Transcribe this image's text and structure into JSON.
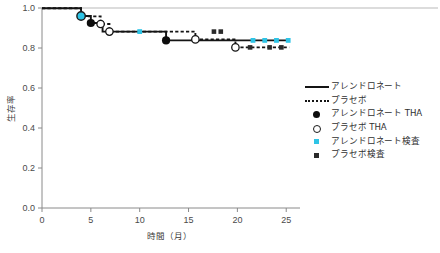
{
  "chart_data": {
    "type": "line",
    "title": "",
    "xlabel": "時間（月）",
    "ylabel": "生存率",
    "xlim": [
      0,
      26
    ],
    "ylim": [
      0.0,
      1.0
    ],
    "xticks": [
      0,
      5,
      10,
      15,
      20,
      25
    ],
    "xticklabels": [
      "0",
      "5",
      "10",
      "15",
      "20",
      "25"
    ],
    "yticks": [
      0.0,
      0.2,
      0.4,
      0.6,
      0.8,
      1.0
    ],
    "yticklabels": [
      "0.0",
      "0.2",
      "0.4",
      "0.6",
      "0.8",
      "1.0"
    ],
    "grid": false,
    "legend_position": "right",
    "series": [
      {
        "name": "アレンドロネート",
        "style": "solid",
        "color": "#141414",
        "steps": [
          {
            "x": 0.0,
            "y": 0.999
          },
          {
            "x": 4.0,
            "y": 0.999
          },
          {
            "x": 4.0,
            "y": 0.96
          },
          {
            "x": 5.0,
            "y": 0.96
          },
          {
            "x": 5.0,
            "y": 0.925
          },
          {
            "x": 6.2,
            "y": 0.925
          },
          {
            "x": 6.2,
            "y": 0.882
          },
          {
            "x": 12.7,
            "y": 0.882
          },
          {
            "x": 12.7,
            "y": 0.838
          },
          {
            "x": 25.3,
            "y": 0.838
          }
        ]
      },
      {
        "name": "プラセボ",
        "style": "dotted",
        "color": "#141414",
        "steps": [
          {
            "x": 0.0,
            "y": 0.999
          },
          {
            "x": 4.0,
            "y": 0.999
          },
          {
            "x": 4.0,
            "y": 0.958
          },
          {
            "x": 6.0,
            "y": 0.958
          },
          {
            "x": 6.0,
            "y": 0.92
          },
          {
            "x": 6.9,
            "y": 0.92
          },
          {
            "x": 6.9,
            "y": 0.882
          },
          {
            "x": 15.7,
            "y": 0.882
          },
          {
            "x": 15.7,
            "y": 0.843
          },
          {
            "x": 19.8,
            "y": 0.843
          },
          {
            "x": 19.8,
            "y": 0.803
          },
          {
            "x": 25.3,
            "y": 0.803
          }
        ]
      }
    ],
    "markers": [
      {
        "series": "アレンドロネート THA",
        "type": "filled-circle",
        "points": [
          {
            "x": 5.0,
            "y": 0.925
          },
          {
            "x": 12.7,
            "y": 0.838
          }
        ]
      },
      {
        "series": "プラセボ THA",
        "type": "open-circle",
        "points": [
          {
            "x": 6.0,
            "y": 0.92
          },
          {
            "x": 6.9,
            "y": 0.882
          },
          {
            "x": 15.7,
            "y": 0.843
          },
          {
            "x": 19.8,
            "y": 0.803
          }
        ]
      },
      {
        "series": "アレンドロネート検査",
        "type": "cyan-square",
        "points": [
          {
            "x": 4.0,
            "y": 0.96
          },
          {
            "x": 10.0,
            "y": 0.882
          },
          {
            "x": 21.6,
            "y": 0.838
          },
          {
            "x": 22.8,
            "y": 0.838
          },
          {
            "x": 24.0,
            "y": 0.838
          },
          {
            "x": 25.2,
            "y": 0.838
          }
        ]
      },
      {
        "series": "プラセボ検査",
        "type": "dark-square",
        "points": [
          {
            "x": 17.6,
            "y": 0.882
          },
          {
            "x": 18.3,
            "y": 0.882
          },
          {
            "x": 21.3,
            "y": 0.803
          },
          {
            "x": 23.3,
            "y": 0.803
          },
          {
            "x": 24.5,
            "y": 0.803
          }
        ]
      }
    ]
  },
  "legend": {
    "items": [
      {
        "label": "アレンドロネート",
        "key": "solid-line"
      },
      {
        "label": "プラセボ",
        "key": "dotted-line"
      },
      {
        "label": "アレンドロネート THA",
        "key": "filled-circle"
      },
      {
        "label": "プラセボ THA",
        "key": "open-circle"
      },
      {
        "label": "アレンドロネート検査",
        "key": "cyan-square"
      },
      {
        "label": "プラセボ検査",
        "key": "dark-square"
      }
    ]
  },
  "colors": {
    "line": "#141414",
    "cyan": "#2ec4e6",
    "dark_marker": "#2a2a2a",
    "axis": "#8a8a8a",
    "tick_text": "#4a4a4a"
  }
}
